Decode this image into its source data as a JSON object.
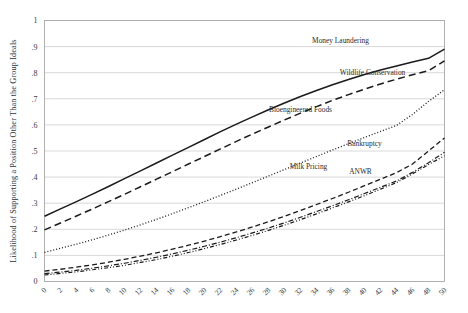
{
  "chart_data": {
    "type": "line",
    "title": "",
    "subtitle": "",
    "xlabel": "",
    "ylabel": "Likelihood of Supporting a Position Other Than the Group Ideals",
    "xlim": [
      0,
      50
    ],
    "ylim": [
      0,
      1
    ],
    "grid": true,
    "grid_axis": "y",
    "legend": "inline-labels-at-end-of-series",
    "x_tick_labels": [
      "0",
      "2",
      "4",
      "6",
      "8",
      "10",
      "12",
      "14",
      "16",
      "18",
      "20",
      "22",
      "24",
      "26",
      "28",
      "30",
      "32",
      "34",
      "36",
      "38",
      "40",
      "42",
      "44",
      "46",
      "48",
      "50"
    ],
    "x_tick_values": [
      0,
      2,
      4,
      6,
      8,
      10,
      12,
      14,
      16,
      18,
      20,
      22,
      24,
      26,
      28,
      30,
      32,
      34,
      36,
      38,
      40,
      42,
      44,
      46,
      48,
      50
    ],
    "x_tick_rotation": 45,
    "y_tick_labels": [
      "0",
      ".1",
      ".2",
      ".3",
      ".4",
      ".5",
      ".6",
      ".7",
      ".8",
      ".9",
      "1"
    ],
    "y_tick_values": [
      0,
      0.1,
      0.2,
      0.3,
      0.4,
      0.5,
      0.6,
      0.7,
      0.8,
      0.9,
      1
    ],
    "x": [
      0,
      2,
      4,
      6,
      8,
      10,
      12,
      14,
      16,
      18,
      20,
      22,
      24,
      26,
      28,
      30,
      32,
      34,
      36,
      38,
      40,
      42,
      44,
      46,
      48,
      50
    ],
    "series": [
      {
        "name": "Money Laundering",
        "style": "solid",
        "dasharray": "",
        "width": 1.5,
        "color": "#1a1a1a",
        "label_x": 37,
        "label_y": 0.915,
        "values": [
          0.25,
          0.278,
          0.306,
          0.335,
          0.364,
          0.394,
          0.424,
          0.454,
          0.484,
          0.514,
          0.544,
          0.574,
          0.603,
          0.631,
          0.658,
          0.684,
          0.709,
          0.732,
          0.754,
          0.774,
          0.793,
          0.81,
          0.826,
          0.841,
          0.855,
          0.89
        ]
      },
      {
        "name": "Wildlife Conservation",
        "style": "long-dash",
        "dasharray": "7,4",
        "width": 1.5,
        "color": "#1a1a1a",
        "label_x": 41,
        "label_y": 0.79,
        "values": [
          0.198,
          0.224,
          0.251,
          0.278,
          0.306,
          0.334,
          0.363,
          0.392,
          0.421,
          0.45,
          0.479,
          0.508,
          0.537,
          0.565,
          0.592,
          0.619,
          0.645,
          0.67,
          0.694,
          0.716,
          0.737,
          0.757,
          0.775,
          0.792,
          0.808,
          0.845
        ]
      },
      {
        "name": "Bioengineered Foods",
        "style": "dotted",
        "dasharray": "1,2",
        "width": 1.3,
        "color": "#1a1a1a",
        "label_x": 32,
        "label_y": 0.65,
        "values": [
          0.112,
          0.127,
          0.143,
          0.16,
          0.178,
          0.197,
          0.217,
          0.238,
          0.26,
          0.283,
          0.306,
          0.33,
          0.354,
          0.379,
          0.404,
          0.429,
          0.454,
          0.479,
          0.504,
          0.528,
          0.552,
          0.575,
          0.598,
          0.64,
          0.69,
          0.735
        ]
      },
      {
        "name": "Bankruptcy",
        "style": "dashed",
        "dasharray": "5,3",
        "width": 1.3,
        "color": "#1a1a1a",
        "label_x": 40,
        "label_y": 0.52,
        "values": [
          0.04,
          0.047,
          0.055,
          0.064,
          0.074,
          0.085,
          0.097,
          0.11,
          0.124,
          0.139,
          0.155,
          0.172,
          0.19,
          0.209,
          0.229,
          0.25,
          0.272,
          0.295,
          0.318,
          0.342,
          0.367,
          0.392,
          0.417,
          0.45,
          0.5,
          0.55
        ]
      },
      {
        "name": "Milk Pricing",
        "style": "dash-dot",
        "dasharray": "5,2,1,2",
        "width": 1.2,
        "color": "#1a1a1a",
        "label_x": 33,
        "label_y": 0.43,
        "values": [
          0.03,
          0.036,
          0.043,
          0.051,
          0.06,
          0.07,
          0.081,
          0.093,
          0.106,
          0.12,
          0.135,
          0.151,
          0.168,
          0.186,
          0.205,
          0.225,
          0.246,
          0.268,
          0.29,
          0.313,
          0.337,
          0.361,
          0.385,
          0.418,
          0.455,
          0.495
        ]
      },
      {
        "name": "ANWR",
        "style": "dash-dot-dot",
        "dasharray": "4,2,1,2,1,2",
        "width": 1.2,
        "color": "#1a1a1a",
        "label_x": 39.5,
        "label_y": 0.41,
        "values": [
          0.025,
          0.031,
          0.037,
          0.045,
          0.053,
          0.062,
          0.073,
          0.084,
          0.097,
          0.111,
          0.126,
          0.142,
          0.159,
          0.177,
          0.196,
          0.216,
          0.237,
          0.259,
          0.282,
          0.305,
          0.329,
          0.354,
          0.379,
          0.412,
          0.448,
          0.482
        ]
      }
    ]
  }
}
